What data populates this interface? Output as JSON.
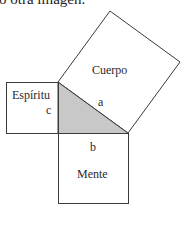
{
  "caption_fragment": "o otra imagen.",
  "diagram": {
    "type": "pythagorean-squares",
    "triangle_fill": "#c8c8c8",
    "stroke_color": "#3a3a3a",
    "squares": [
      {
        "label": "Cuerpo",
        "side": "a"
      },
      {
        "label": "Espíritu",
        "side": "c"
      },
      {
        "label": "Mente",
        "side": "b"
      }
    ],
    "side_labels": {
      "a": "a",
      "b": "b",
      "c": "c"
    }
  }
}
